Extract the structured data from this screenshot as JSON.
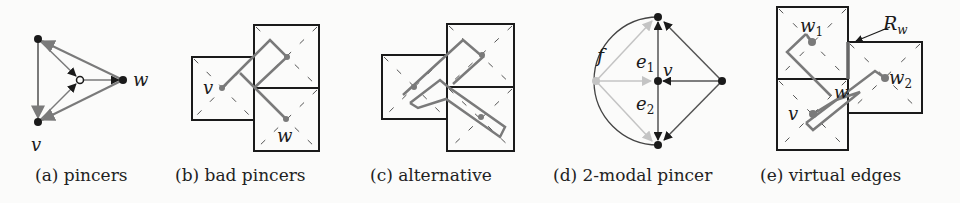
{
  "figure": {
    "subfigures": [
      {
        "id": "a",
        "caption": "(a) pincers",
        "labels": {
          "v": "v",
          "w": "w"
        }
      },
      {
        "id": "b",
        "caption": "(b) bad pincers",
        "labels": {
          "v": "v",
          "w": "w"
        }
      },
      {
        "id": "c",
        "caption": "(c) alternative",
        "labels": {}
      },
      {
        "id": "d",
        "caption": "(d) 2-modal pincer",
        "labels": {
          "f": "f",
          "e1": "e",
          "e1_sub": "1",
          "e2": "e",
          "e2_sub": "2",
          "v": "v"
        }
      },
      {
        "id": "e",
        "caption": "(e) virtual edges",
        "labels": {
          "w1": "w",
          "w1_sub": "1",
          "w2": "w",
          "w2_sub": "2",
          "w": "w",
          "v": "v",
          "Rw": "R",
          "Rw_sub": "w"
        }
      }
    ],
    "colors": {
      "ink": "#1a1a1a",
      "edge_gray": "#7a7a7a",
      "light_gray": "#c4c4c4",
      "background": "#fbfbfa"
    }
  }
}
